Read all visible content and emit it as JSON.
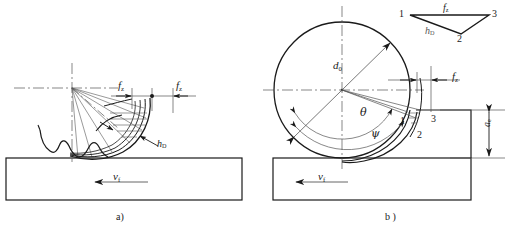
{
  "figure": {
    "title_a": "a)",
    "title_b": "b )"
  },
  "diagram_a": {
    "caption": "a)",
    "labels": {
      "feed_left": "f",
      "feed_left_sub": "z",
      "feed_right": "f",
      "feed_right_sub": "z",
      "chip_thickness": "h",
      "chip_thickness_sub": "D",
      "feed_velocity": "v",
      "feed_velocity_sub": "f"
    }
  },
  "diagram_b": {
    "caption": "b )",
    "labels": {
      "diameter": "d",
      "diameter_sub": "0",
      "feed": "f",
      "feed_sub": "z",
      "angle_theta": "θ",
      "angle_psi": "ψ",
      "depth_of_cut": "a",
      "depth_of_cut_sub": "e",
      "feed_velocity": "v",
      "feed_velocity_sub": "f",
      "point_1": "1",
      "point_2": "2",
      "point_3": "3"
    },
    "triangle_legend": {
      "vertex_1": "1",
      "vertex_2": "2",
      "vertex_3": "3",
      "edge_top": "f",
      "edge_top_sub": "z",
      "edge_left": "h",
      "edge_left_sub": "D"
    }
  },
  "style": {
    "line_color": "#1a1a1a",
    "thin_color": "#555555",
    "background": "#ffffff"
  }
}
